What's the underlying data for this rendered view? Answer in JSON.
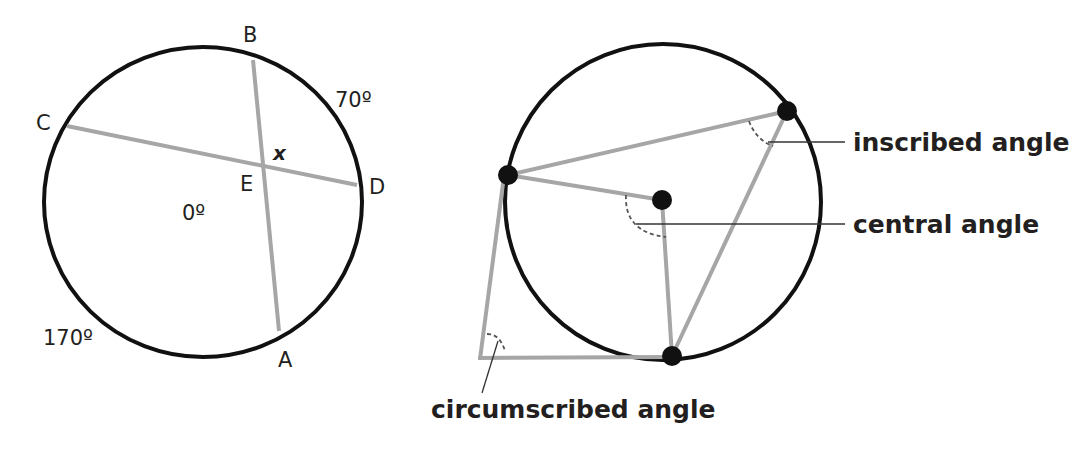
{
  "colors": {
    "circle": "#111111",
    "chord": "#a6a6a6",
    "text": "#231f20",
    "leader": "#333333"
  },
  "left_diagram": {
    "points": {
      "A": "A",
      "B": "B",
      "C": "C",
      "D": "D",
      "E": "E"
    },
    "angle_label": "x",
    "arcs": {
      "BD": "70º",
      "CA": "170º",
      "center": "0º"
    }
  },
  "right_diagram": {
    "labels": {
      "inscribed": "inscribed angle",
      "central": "central angle",
      "circumscribed": "circumscribed angle"
    }
  }
}
